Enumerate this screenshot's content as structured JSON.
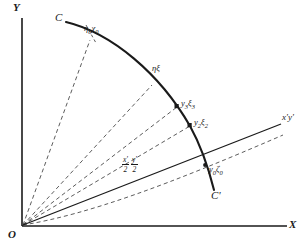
{
  "figure": {
    "type": "geometry-diagram",
    "background_color": "#ffffff",
    "ink_color": "#1a1a1a"
  },
  "axes": {
    "y_label": "Y",
    "x_label": "X",
    "origin_label": "O",
    "oblique_label": "x'y'"
  },
  "curve": {
    "start_label": "C",
    "end_label": "C'"
  },
  "points": [
    {
      "id": "p0",
      "label_html": "η<sub>0</sub>χ<sub>0</sub>",
      "label_text": "η0χ0"
    },
    {
      "id": "p1",
      "label_html": "ηξ",
      "label_text": "ηξ"
    },
    {
      "id": "p2",
      "label_html": "y<sub>3</sub>ξ<sub>3</sub>",
      "label_text": "y3ξ3"
    },
    {
      "id": "p3",
      "label_html": "y<sub>2</sub>ξ<sub>2</sub>",
      "label_text": "y2ξ2"
    },
    {
      "id": "p4",
      "label_html": "y<sub>0</sub>ζ<sub>0</sub>",
      "label_text": "y0ζ0"
    }
  ],
  "fractions": [
    {
      "numerator": "x'",
      "denominator": "2"
    },
    {
      "numerator": "y'",
      "denominator": "2"
    }
  ]
}
